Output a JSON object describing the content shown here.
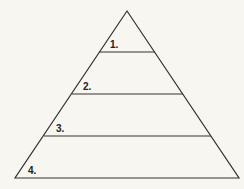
{
  "diagram": {
    "type": "pyramid",
    "background": "#f8f6f0",
    "stroke": "#333333",
    "levels": [
      {
        "label": "1."
      },
      {
        "label": "2."
      },
      {
        "label": "3."
      },
      {
        "label": "4."
      }
    ]
  }
}
